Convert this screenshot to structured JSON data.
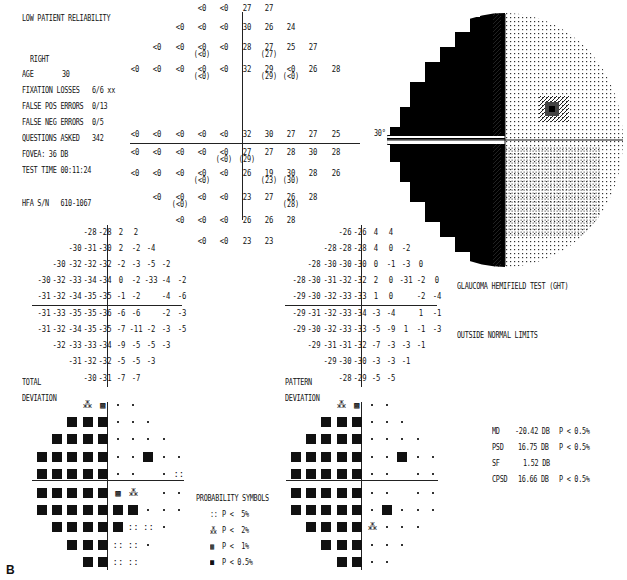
{
  "header": {
    "reliability": "LOW PATIENT RELIABILITY",
    "eye": "RIGHT",
    "age_label": "AGE",
    "age": "30",
    "fixation_losses_label": "FIXATION LOSSES",
    "fixation_losses": "6/6 xx",
    "false_pos_label": "FALSE POS ERRORS",
    "false_pos": "0/13",
    "false_neg_label": "FALSE NEG ERRORS",
    "false_neg": "0/5",
    "questions_label": "QUESTIONS ASKED",
    "questions": "342",
    "fovea": "FOVEA: 36 DB",
    "test_time": "TEST TIME 00:11:24",
    "hfa_sn": "HFA S/N   610-1067"
  },
  "sensitivity_grid": {
    "rows": [
      {
        "y": 0,
        "cells": [
          [
            "<0",
            ""
          ],
          [
            "<0",
            ""
          ],
          [
            "27",
            ""
          ],
          [
            "27",
            ""
          ]
        ],
        "start": 3
      },
      {
        "y": 1,
        "cells": [
          [
            "<0",
            ""
          ],
          [
            "<0",
            ""
          ],
          [
            "<0",
            ""
          ],
          [
            "30",
            ""
          ],
          [
            "26",
            ""
          ],
          [
            "24",
            ""
          ]
        ],
        "start": 2
      },
      {
        "y": 2,
        "cells": [
          [
            "<0",
            ""
          ],
          [
            "<0",
            ""
          ],
          [
            "<0",
            "(<0)"
          ],
          [
            "<0",
            ""
          ],
          [
            "28",
            ""
          ],
          [
            "27",
            "(27)"
          ],
          [
            "25",
            ""
          ],
          [
            "27",
            ""
          ]
        ],
        "start": 1
      },
      {
        "y": 3,
        "cells": [
          [
            "<0",
            ""
          ],
          [
            "<0",
            ""
          ],
          [
            "<0",
            ""
          ],
          [
            "<0",
            "(<0)"
          ],
          [
            "<0",
            ""
          ],
          [
            "32",
            ""
          ],
          [
            "29",
            "(29)"
          ],
          [
            "<0",
            "(<0)"
          ],
          [
            "26",
            ""
          ],
          [
            "28",
            ""
          ]
        ],
        "start": 0
      },
      {
        "y": 4,
        "cells": [
          [
            "<0",
            ""
          ],
          [
            "<0",
            ""
          ],
          [
            "<0",
            ""
          ],
          [
            "<0",
            ""
          ],
          [
            "<0",
            ""
          ],
          [
            "32",
            ""
          ],
          [
            "30",
            ""
          ],
          [
            "27",
            ""
          ],
          [
            "27",
            ""
          ],
          [
            "25",
            ""
          ]
        ],
        "start": 0
      },
      {
        "y": 5,
        "cells": [
          [
            "<0",
            ""
          ],
          [
            "<0",
            ""
          ],
          [
            "<0",
            ""
          ],
          [
            "<0",
            ""
          ],
          [
            "<0",
            "(<0)"
          ],
          [
            "27",
            "(29)"
          ],
          [
            "27",
            ""
          ],
          [
            "28",
            ""
          ],
          [
            "30",
            ""
          ],
          [
            "28",
            ""
          ]
        ],
        "start": 0
      },
      {
        "y": 6,
        "cells": [
          [
            "<0",
            ""
          ],
          [
            "<0",
            ""
          ],
          [
            "<0",
            ""
          ],
          [
            "<0",
            "(<0)"
          ],
          [
            "<0",
            ""
          ],
          [
            "26",
            ""
          ],
          [
            "19",
            "(23)"
          ],
          [
            "30",
            "(30)"
          ],
          [
            "28",
            ""
          ],
          [
            "26",
            ""
          ]
        ],
        "start": 0
      },
      {
        "y": 7,
        "cells": [
          [
            "<0",
            ""
          ],
          [
            "<0",
            "(<0)"
          ],
          [
            "<0",
            ""
          ],
          [
            "<0",
            ""
          ],
          [
            "23",
            ""
          ],
          [
            "27",
            ""
          ],
          [
            "26",
            "(28)"
          ],
          [
            "28",
            ""
          ]
        ],
        "start": 1
      },
      {
        "y": 8,
        "cells": [
          [
            "<0",
            ""
          ],
          [
            "<0",
            ""
          ],
          [
            "<0",
            ""
          ],
          [
            "26",
            ""
          ],
          [
            "26",
            ""
          ],
          [
            "28",
            ""
          ]
        ],
        "start": 2
      },
      {
        "y": 9,
        "cells": [
          [
            "<0",
            ""
          ],
          [
            "<0",
            ""
          ],
          [
            "23",
            ""
          ],
          [
            "23",
            ""
          ]
        ],
        "start": 3
      }
    ]
  },
  "total_deviation": {
    "label1": "TOTAL",
    "label2": "DEVIATION",
    "rows": [
      {
        "start": 3,
        "vals": [
          "-28",
          "-28",
          "2",
          "2"
        ]
      },
      {
        "start": 2,
        "vals": [
          "-30",
          "-31",
          "-30",
          "2",
          "-2",
          "-4"
        ]
      },
      {
        "start": 1,
        "vals": [
          "-30",
          "-32",
          "-32",
          "-32",
          "-2",
          "-3",
          "-5",
          "-2"
        ]
      },
      {
        "start": 0,
        "vals": [
          "-30",
          "-32",
          "-33",
          "-34",
          "-34",
          "0",
          "-2",
          "-33",
          "-4",
          "-2"
        ]
      },
      {
        "start": 0,
        "vals": [
          "-31",
          "-32",
          "-34",
          "-35",
          "-35",
          "-1",
          "-2",
          "",
          "-4",
          "-6"
        ]
      },
      {
        "start": 0,
        "vals": [
          "-31",
          "-33",
          "-35",
          "-35",
          "-36",
          "-6",
          "-6",
          "",
          "-2",
          "-3"
        ]
      },
      {
        "start": 0,
        "vals": [
          "-31",
          "-32",
          "-34",
          "-35",
          "-35",
          "-7",
          "-11",
          "-2",
          "-3",
          "-5"
        ]
      },
      {
        "start": 1,
        "vals": [
          "-32",
          "-33",
          "-33",
          "-34",
          "-9",
          "-5",
          "-5",
          "-3"
        ]
      },
      {
        "start": 2,
        "vals": [
          "-31",
          "-32",
          "-32",
          "-5",
          "-5",
          "-3"
        ]
      },
      {
        "start": 3,
        "vals": [
          "-30",
          "-31",
          "-7",
          "-7"
        ]
      }
    ],
    "prob_rows": [
      {
        "start": 3,
        "vals": [
          "2",
          "1",
          "d",
          "d"
        ]
      },
      {
        "start": 2,
        "vals": [
          "s",
          "s",
          "s",
          "d",
          "d",
          "d"
        ]
      },
      {
        "start": 1,
        "vals": [
          "s",
          "s",
          "s",
          "s",
          "d",
          "d",
          "d",
          "d"
        ]
      },
      {
        "start": 0,
        "vals": [
          "s",
          "s",
          "s",
          "s",
          "s",
          "d",
          "d",
          "s",
          "d",
          "d"
        ]
      },
      {
        "start": 0,
        "vals": [
          "s",
          "s",
          "s",
          "s",
          "s",
          "d",
          "d",
          "",
          "d",
          "5"
        ]
      },
      {
        "start": 0,
        "vals": [
          "s",
          "s",
          "s",
          "s",
          "s",
          "1",
          "2",
          "",
          "d",
          "d"
        ]
      },
      {
        "start": 0,
        "vals": [
          "s",
          "s",
          "s",
          "s",
          "s",
          "s",
          "s",
          "d",
          "d",
          "d"
        ]
      },
      {
        "start": 1,
        "vals": [
          "s",
          "s",
          "s",
          "s",
          "s",
          "5",
          "5",
          "d"
        ]
      },
      {
        "start": 2,
        "vals": [
          "s",
          "s",
          "s",
          "5",
          "5",
          "d"
        ]
      },
      {
        "start": 3,
        "vals": [
          "s",
          "s",
          "5",
          "5"
        ]
      }
    ]
  },
  "pattern_deviation": {
    "label1": "PATTERN",
    "label2": "DEVIATION",
    "rows": [
      {
        "start": 3,
        "vals": [
          "-26",
          "-26",
          "4",
          "4"
        ]
      },
      {
        "start": 2,
        "vals": [
          "-28",
          "-28",
          "-28",
          "4",
          "0",
          "-2"
        ]
      },
      {
        "start": 1,
        "vals": [
          "-28",
          "-30",
          "-30",
          "-30",
          "0",
          "-1",
          "-3",
          "0"
        ]
      },
      {
        "start": 0,
        "vals": [
          "-28",
          "-30",
          "-31",
          "-32",
          "-32",
          "2",
          "0",
          "-31",
          "-2",
          "0"
        ]
      },
      {
        "start": 0,
        "vals": [
          "-29",
          "-30",
          "-32",
          "-33",
          "-33",
          "1",
          "0",
          "",
          "-2",
          "-4"
        ]
      },
      {
        "start": 0,
        "vals": [
          "-29",
          "-31",
          "-32",
          "-33",
          "-34",
          "-3",
          "-4",
          "",
          "1",
          "-1"
        ]
      },
      {
        "start": 0,
        "vals": [
          "-29",
          "-30",
          "-32",
          "-33",
          "-33",
          "-5",
          "-9",
          "1",
          "-1",
          "-3"
        ]
      },
      {
        "start": 1,
        "vals": [
          "-29",
          "-31",
          "-31",
          "-32",
          "-7",
          "-3",
          "-3",
          "-1"
        ]
      },
      {
        "start": 2,
        "vals": [
          "-29",
          "-30",
          "-30",
          "-3",
          "-3",
          "-1"
        ]
      },
      {
        "start": 3,
        "vals": [
          "-28",
          "-29",
          "-5",
          "-5"
        ]
      }
    ],
    "prob_rows": [
      {
        "start": 3,
        "vals": [
          "2",
          "1",
          "d",
          "d"
        ]
      },
      {
        "start": 2,
        "vals": [
          "s",
          "s",
          "s",
          "d",
          "d",
          "d"
        ]
      },
      {
        "start": 1,
        "vals": [
          "s",
          "s",
          "s",
          "s",
          "d",
          "d",
          "d",
          "d"
        ]
      },
      {
        "start": 0,
        "vals": [
          "s",
          "s",
          "s",
          "s",
          "s",
          "d",
          "d",
          "s",
          "d",
          "d"
        ]
      },
      {
        "start": 0,
        "vals": [
          "s",
          "s",
          "s",
          "s",
          "s",
          "d",
          "d",
          "",
          "d",
          "d"
        ]
      },
      {
        "start": 0,
        "vals": [
          "s",
          "s",
          "s",
          "s",
          "s",
          "d",
          "d",
          "",
          "d",
          "d"
        ]
      },
      {
        "start": 0,
        "vals": [
          "s",
          "s",
          "s",
          "s",
          "s",
          "d",
          "s",
          "d",
          "d",
          "d"
        ]
      },
      {
        "start": 1,
        "vals": [
          "s",
          "s",
          "s",
          "s",
          "2",
          "d",
          "d",
          "d"
        ]
      },
      {
        "start": 2,
        "vals": [
          "s",
          "s",
          "s",
          "d",
          "d",
          "d"
        ]
      },
      {
        "start": 3,
        "vals": [
          "s",
          "s",
          "d",
          "d"
        ]
      }
    ]
  },
  "greyscale": {
    "scale_label": "30°"
  },
  "ght": {
    "title": "GLAUCOMA HEMIFIELD TEST (GHT)",
    "result": "OUTSIDE NORMAL LIMITS"
  },
  "probability_symbols": {
    "title": "PROBABILITY SYMBOLS",
    "items": [
      {
        "sym": "::",
        "label": "P <  5%"
      },
      {
        "sym": "⁂",
        "label": "P <  2%"
      },
      {
        "sym": "▩",
        "label": "P <  1%"
      },
      {
        "sym": "■",
        "label": "P < 0.5%"
      }
    ]
  },
  "global_indices": [
    {
      "name": "MD",
      "value": "-20.42 DB",
      "p": "P < 0.5%"
    },
    {
      "name": "PSD",
      "value": "16.75 DB",
      "p": "P < 0.5%"
    },
    {
      "name": "SF",
      "value": "1.52 DB",
      "p": ""
    },
    {
      "name": "CPSD",
      "value": "16.66 DB",
      "p": "P < 0.5%"
    }
  ],
  "figure_label": "B"
}
